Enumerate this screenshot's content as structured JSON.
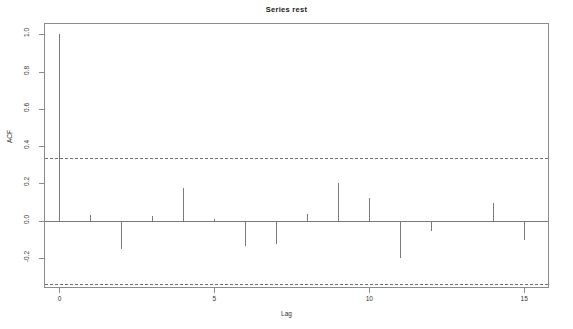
{
  "title": "Series  rest",
  "axes": {
    "xlabel": "Lag",
    "ylabel": "ACF",
    "xticks": [
      "0",
      "5",
      "10",
      "15"
    ],
    "xtick_values": [
      0,
      5,
      10,
      15
    ],
    "yticks": [
      "1.0",
      "0.8",
      "0.6",
      "0.4",
      "0.2",
      "0.0",
      "-0.2"
    ],
    "ytick_values": [
      1.0,
      0.8,
      0.6,
      0.4,
      0.2,
      0.0,
      -0.2
    ]
  },
  "colors": {
    "frame": "#8c8c8c",
    "spike": "#7a7a7a",
    "confidence": "#6f6f6f",
    "text": "#333333",
    "background": "#ffffff"
  },
  "chart_data": {
    "type": "bar",
    "title": "Series  rest",
    "xlabel": "Lag",
    "ylabel": "ACF",
    "xlim": [
      -0.5,
      15.8
    ],
    "ylim": [
      -0.36,
      1.06
    ],
    "grid": false,
    "legend": false,
    "confidence_upper": 0.337,
    "confidence_lower": -0.337,
    "categories": [
      0,
      1,
      2,
      3,
      4,
      5,
      6,
      7,
      8,
      9,
      10,
      11,
      12,
      13,
      14,
      15
    ],
    "values": [
      1.0,
      0.03,
      -0.15,
      0.025,
      0.175,
      0.01,
      -0.135,
      -0.125,
      0.035,
      0.2,
      0.12,
      -0.2,
      -0.055,
      0.0,
      0.095,
      -0.105
    ]
  }
}
